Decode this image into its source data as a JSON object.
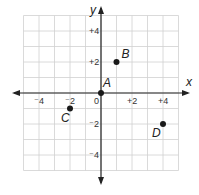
{
  "chart_data": {
    "type": "scatter",
    "title": "",
    "xlabel": "x",
    "ylabel": "y",
    "xlim": [
      -5,
      5
    ],
    "ylim": [
      -5,
      5
    ],
    "grid": true,
    "x_ticks": [
      {
        "v": -4,
        "label": "⁻4"
      },
      {
        "v": -2,
        "label": "⁻2"
      },
      {
        "v": 0,
        "label": "0"
      },
      {
        "v": 2,
        "label": "+2"
      },
      {
        "v": 4,
        "label": "+4"
      }
    ],
    "y_ticks": [
      {
        "v": 4,
        "label": "+4"
      },
      {
        "v": 2,
        "label": "+2"
      },
      {
        "v": -2,
        "label": "⁻2"
      },
      {
        "v": -4,
        "label": "⁻4"
      }
    ],
    "points": [
      {
        "label": "A",
        "x": 0,
        "y": 0
      },
      {
        "label": "B",
        "x": 1,
        "y": 2
      },
      {
        "label": "C",
        "x": -2,
        "y": -1
      },
      {
        "label": "D",
        "x": 4,
        "y": -2
      }
    ]
  },
  "colors": {
    "grid": "#d0d0d0",
    "axis": "#222222",
    "point": "#1a1a1a"
  }
}
